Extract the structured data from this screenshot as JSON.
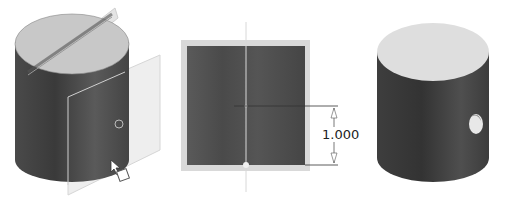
{
  "panels": [
    {
      "id": "sketch-plane-view",
      "description": "Cylinder with work plane and sketch point"
    },
    {
      "id": "sketch-view",
      "description": "Front sketch with dimension"
    },
    {
      "id": "result-view",
      "description": "Cylinder with hole"
    }
  ],
  "dimension": {
    "value": "1.000"
  },
  "colors": {
    "body_dark": "#3a3a3a",
    "body_mid": "#555555",
    "top_face": "#cfcfcf",
    "top_face_result": "#e0e0e0",
    "plane": "#e6e6e6",
    "frame": "#d9d9d9"
  }
}
